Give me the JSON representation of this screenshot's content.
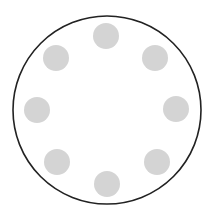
{
  "canvas": {
    "width": 212,
    "height": 223,
    "background": "#ffffff"
  },
  "ring": {
    "cx": 107,
    "cy": 110,
    "r": 94,
    "stroke": "#222222",
    "stroke_width": 1.6
  },
  "dots": {
    "radius": 13,
    "fill": "#d4d4d4",
    "items": [
      {
        "position": "top",
        "cx": 106,
        "cy": 36
      },
      {
        "position": "top-right",
        "cx": 155,
        "cy": 58
      },
      {
        "position": "right",
        "cx": 176,
        "cy": 109
      },
      {
        "position": "bottom-right",
        "cx": 157,
        "cy": 162
      },
      {
        "position": "bottom",
        "cx": 107,
        "cy": 184
      },
      {
        "position": "bottom-left",
        "cx": 57,
        "cy": 162
      },
      {
        "position": "left",
        "cx": 37,
        "cy": 110
      },
      {
        "position": "top-left",
        "cx": 56,
        "cy": 58
      }
    ]
  }
}
